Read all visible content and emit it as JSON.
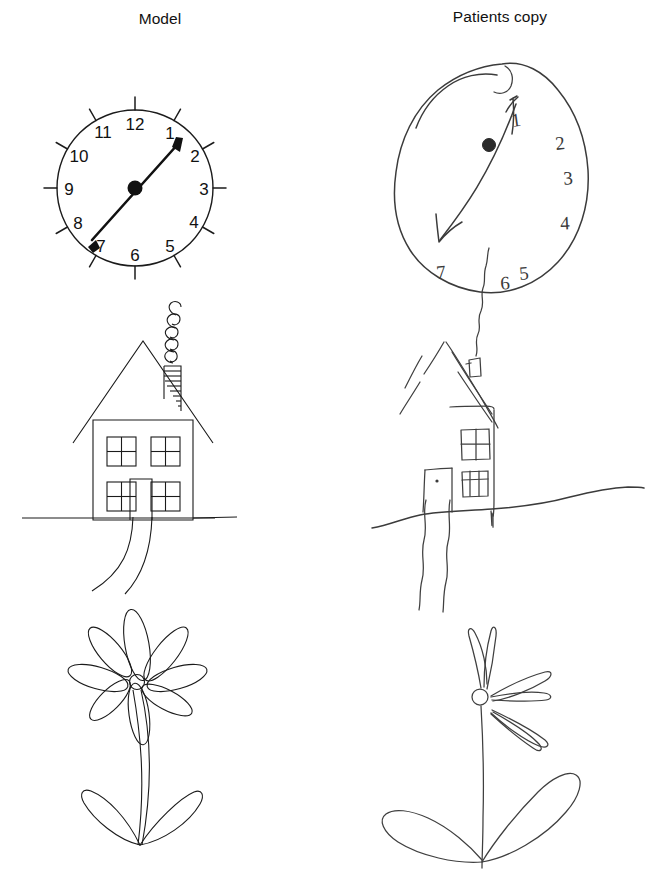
{
  "figure": {
    "kind": "neuropsychology-drawing-comparison",
    "columns": [
      {
        "id": "model",
        "title": "Model"
      },
      {
        "id": "patient",
        "title": "Patients copy"
      }
    ],
    "rows": [
      {
        "id": "clock",
        "name": "clock-drawing"
      },
      {
        "id": "house",
        "name": "house-drawing"
      },
      {
        "id": "flower",
        "name": "flower-drawing"
      }
    ],
    "colors": {
      "ink": "#1b1b1b",
      "hand_ink": "#3b3b3b",
      "background": "#ffffff"
    }
  },
  "model_clock": {
    "name": "model-clock",
    "shape": "circle",
    "center": [
      135,
      188
    ],
    "radius": 78,
    "numerals": [
      "12",
      "1",
      "2",
      "3",
      "4",
      "5",
      "6",
      "7",
      "8",
      "9",
      "10",
      "11"
    ],
    "tick_count": 12,
    "hands": {
      "type": "double-headed-arrow",
      "from_label": "7",
      "to_label": "1",
      "hub": "filled-dot"
    }
  },
  "patient_clock": {
    "name": "patient-clock",
    "shape": "irregular-closed-blob",
    "numerals": [
      "1",
      "2",
      "3",
      "4",
      "5",
      "6",
      "7"
    ],
    "numeral_placement": "crowded-right-and-bottom",
    "hands": {
      "type": "double-headed-arrow",
      "from_label": "7",
      "to_label": "1",
      "hub": "filled-dot"
    }
  },
  "model_house": {
    "name": "model-house",
    "parts": [
      "roof",
      "chimney",
      "hatched-chimney",
      "spiral-smoke",
      "facade",
      "windows",
      "door",
      "ground-line",
      "path"
    ],
    "window_count": 4,
    "window_panes": 4,
    "door_count": 1,
    "smoke_style": "spiral-coil"
  },
  "patient_house": {
    "name": "patient-house",
    "parts": [
      "broken-roof-lines",
      "chimney",
      "wavy-smoke",
      "partial-facade",
      "windows",
      "door",
      "wavy-ground-line",
      "wavy-path"
    ],
    "window_count": 2,
    "window_panes": 4,
    "door_count": 1,
    "smoke_style": "wavy-line"
  },
  "model_flower": {
    "name": "model-flower",
    "petal_count": 8,
    "center": "small-circle",
    "stem": "double-line-curved",
    "leaf_count": 2
  },
  "patient_flower": {
    "name": "patient-flower",
    "petal_count": 5,
    "center": "small-circle",
    "stem": "single-line",
    "leaf_count": 2
  }
}
